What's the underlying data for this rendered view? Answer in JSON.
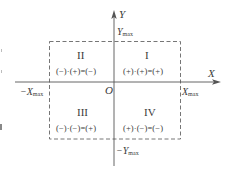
{
  "axes": {
    "x_label": "X",
    "y_label": "Y",
    "origin_label": "O"
  },
  "limits": {
    "x_max": {
      "base": "X",
      "sub": "max"
    },
    "neg_x_max": {
      "base": "−X",
      "sub": "max"
    },
    "y_max": {
      "base": "Y",
      "sub": "max"
    },
    "neg_y_max": {
      "base": "−Y",
      "sub": "max"
    }
  },
  "quadrants": [
    {
      "numeral": "I",
      "rule": "(+)·(+)=(+)"
    },
    {
      "numeral": "II",
      "rule": "(−)·(+)=(−)"
    },
    {
      "numeral": "III",
      "rule": "(−)·(−)=(+)"
    },
    {
      "numeral": "IV",
      "rule": "(+)·(−)=(−)"
    }
  ],
  "colors": {
    "axis": "#555555",
    "dashed_box": "#666666",
    "text": "#3a3a3a"
  }
}
